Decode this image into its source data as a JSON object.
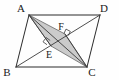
{
  "figure": {
    "background_color": "#fefefe",
    "stroke_color": "#2b2b2b",
    "shade_color": "#c2c2c2",
    "width": 119,
    "height": 80
  },
  "vertices": [
    {
      "id": "A",
      "label": "A",
      "x": 29,
      "y": 15,
      "label_x": 21,
      "label_y": 12
    },
    {
      "id": "D",
      "label": "D",
      "x": 100,
      "y": 15,
      "label_x": 102,
      "label_y": 12
    },
    {
      "id": "B",
      "label": "B",
      "x": 16,
      "y": 67,
      "label_x": 6,
      "label_y": 74
    },
    {
      "id": "C",
      "label": "C",
      "x": 87,
      "y": 67,
      "label_x": 89,
      "label_y": 74
    }
  ],
  "interior_points": [
    {
      "id": "E",
      "label": "E",
      "x": 51,
      "y": 46,
      "label_x": 47,
      "label_y": 57
    },
    {
      "id": "F",
      "label": "F",
      "x": 65,
      "y": 34,
      "label_x": 60,
      "label_y": 29
    }
  ],
  "edges": [
    {
      "name": "side-AD",
      "from": "A",
      "to": "D"
    },
    {
      "name": "side-DC",
      "from": "D",
      "to": "C"
    },
    {
      "name": "side-CB",
      "from": "C",
      "to": "B"
    },
    {
      "name": "side-BA",
      "from": "B",
      "to": "A"
    }
  ],
  "diagonals": [
    {
      "name": "diagonal-AC",
      "from": "A",
      "to": "C"
    },
    {
      "name": "diagonal-BD",
      "from": "B",
      "to": "D"
    }
  ],
  "cevians": [
    {
      "name": "segment-AE",
      "from": "A",
      "to": "E"
    },
    {
      "name": "segment-CF",
      "from": "C",
      "to": "F"
    }
  ],
  "shaded_region": {
    "name": "quadrilateral-AECF",
    "vertex_ids": [
      "A",
      "E",
      "C",
      "F"
    ],
    "points": "29,15 51,46 87,67 65,34"
  },
  "right_angles": [
    {
      "name": "right-angle-at-E",
      "at": "E",
      "cx": 46,
      "cy": 41
    },
    {
      "name": "right-angle-at-F",
      "at": "F",
      "cx": 70,
      "cy": 30
    }
  ]
}
